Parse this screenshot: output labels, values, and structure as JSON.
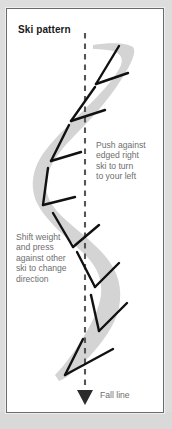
{
  "figure": {
    "title": "Ski pattern",
    "background_color": "#dddddd",
    "panel_color": "#ffffff",
    "frame_color": "#6b6b6b",
    "track_color": "#d4d4d4",
    "ski_mark_color": "#111111",
    "text_color": "#6e6e6e",
    "title_color": "#1a1a1a"
  },
  "callouts": [
    {
      "id": "push-against-edged-right-ski",
      "text": "Push against\nedged right\nski to turn\nto your left"
    },
    {
      "id": "shift-weight-and-press",
      "text": "Shift weight\nand press\nagainst other\nski to change\ndirection"
    }
  ],
  "fall_line": {
    "label": "Fall line",
    "line_style": "dashed",
    "arrow_direction": "down",
    "x_position": 84
  },
  "diagram": {
    "ski_mark_pairs": 7,
    "track_direction": "top-right to bottom-left"
  }
}
